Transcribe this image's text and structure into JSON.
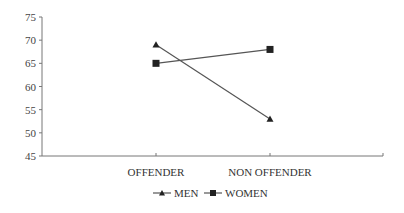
{
  "chart_data": {
    "type": "line",
    "title": "",
    "xlabel": "",
    "ylabel": "",
    "categories": [
      "OFFENDER",
      "NON OFFENDER"
    ],
    "series": [
      {
        "name": "MEN",
        "marker": "triangle",
        "values": [
          69,
          53
        ]
      },
      {
        "name": "WOMEN",
        "marker": "square",
        "values": [
          65,
          68
        ]
      }
    ],
    "ylim": [
      45,
      75
    ],
    "yticks": [
      45,
      50,
      55,
      60,
      65,
      70,
      75
    ],
    "grid": false,
    "legend_position": "bottom"
  },
  "colors": {
    "line": "#555555",
    "marker": "#222222",
    "axis": "#777777"
  }
}
